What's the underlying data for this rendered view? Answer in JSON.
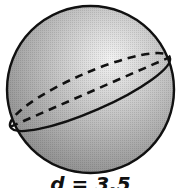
{
  "figure": {
    "shape": "sphere",
    "label": "d = 3.5",
    "colors": {
      "outline": "#111111",
      "fill_light": "#eeeeee",
      "fill_mid": "#bdbdbd",
      "fill_dark": "#8a8a8a"
    },
    "elements": {
      "outline": "sphere-outline",
      "back_arc": "dashed great-circle back arc",
      "diameter": "dashed diameter line",
      "front_arc": "solid great-circle front arc"
    }
  }
}
